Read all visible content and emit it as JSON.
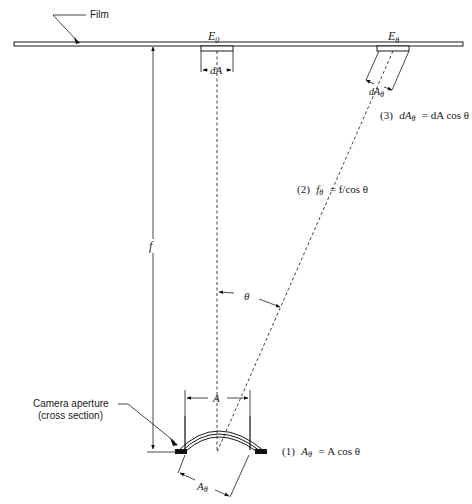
{
  "diagram": {
    "labels": {
      "film": "Film",
      "E_center": "E",
      "E_center_sub": "0",
      "E_theta": "E",
      "E_theta_sub": "θ",
      "dA": "dA",
      "dA_theta": "dA",
      "dA_theta_sub": "θ",
      "f": "f",
      "theta": "θ",
      "A": "A",
      "A_theta": "A",
      "A_theta_sub": "θ",
      "aperture_line1": "Camera aperture",
      "aperture_line2": "(cross section)"
    },
    "equations": {
      "eq1": {
        "number": "(1)",
        "lhs": "A",
        "lhs_sub": "θ",
        "rhs": "= A cos θ"
      },
      "eq2": {
        "number": "(2)",
        "lhs": "f",
        "lhs_sub": "θ",
        "rhs": "= f/cos θ"
      },
      "eq3": {
        "number": "(3)",
        "lhs": "dA",
        "lhs_sub": "θ",
        "rhs": "= dA cos θ"
      }
    },
    "colors": {
      "ink": "#1a1a1a",
      "background": "#ffffff"
    }
  }
}
